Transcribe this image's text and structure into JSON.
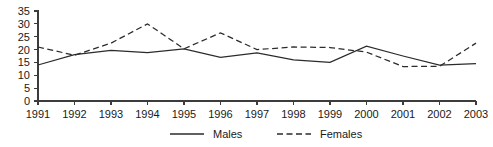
{
  "chart_data": {
    "type": "line",
    "title": "",
    "subtitle": "",
    "xlabel": "",
    "ylabel": "",
    "x": [
      1991,
      1992,
      1993,
      1994,
      1995,
      1996,
      1997,
      1998,
      1999,
      2000,
      2001,
      2002,
      2003
    ],
    "categories": [
      "1991",
      "1992",
      "1993",
      "1994",
      "1995",
      "1996",
      "1997",
      "1998",
      "1999",
      "2000",
      "2001",
      "2002",
      "2003"
    ],
    "series": [
      {
        "name": "Males",
        "line_style": "solid",
        "color": "#2b2b2b",
        "values": [
          14.0,
          18.0,
          19.7,
          18.8,
          20.3,
          17.0,
          18.7,
          16.0,
          15.0,
          21.3,
          17.5,
          14.0,
          14.5
        ]
      },
      {
        "name": "Females",
        "line_style": "dashed",
        "color": "#2b2b2b",
        "values": [
          21.0,
          17.8,
          22.5,
          30.0,
          20.3,
          26.5,
          20.0,
          21.0,
          20.8,
          19.0,
          13.4,
          13.5,
          22.5
        ]
      }
    ],
    "ylim": [
      0,
      35
    ],
    "xlim": [
      1991,
      2003
    ],
    "yticks": [
      0,
      5,
      10,
      15,
      20,
      25,
      30,
      35
    ],
    "ytick_labels": [
      "0",
      "5",
      "10",
      "15",
      "20",
      "25",
      "30",
      "35"
    ],
    "xtick_labels": [
      "1991",
      "1992",
      "1993",
      "1994",
      "1995",
      "1996",
      "1997",
      "1998",
      "1999",
      "2000",
      "2001",
      "2002",
      "2003"
    ],
    "grid": false,
    "legend_position": "bottom-center",
    "legend": [
      {
        "label": "Males",
        "line_style": "solid"
      },
      {
        "label": "Females",
        "line_style": "dashed"
      }
    ]
  },
  "legend": {
    "males_label": "Males",
    "females_label": "Females"
  },
  "colors": {
    "axis": "#3c3c3c",
    "series": "#2b2b2b",
    "background": "#ffffff",
    "text": "#1a1a1a"
  }
}
